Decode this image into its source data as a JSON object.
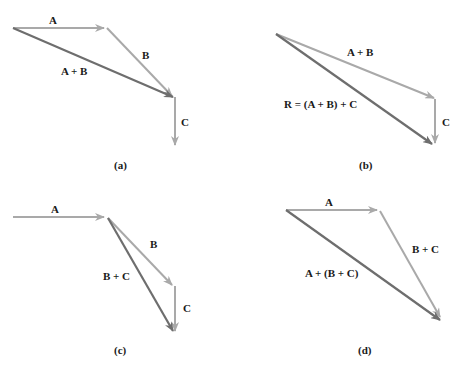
{
  "colors": {
    "light_vector": "#a9a9a9",
    "dark_vector": "#6e6e6e",
    "text": "#1a1a1a",
    "background": "#ffffff"
  },
  "panels": [
    {
      "caption": "(a)",
      "labels": {
        "A": "A",
        "B": "B",
        "AB": "A + B",
        "C": "C"
      }
    },
    {
      "caption": "(b)",
      "labels": {
        "AB": "A + B",
        "R": "R = (A + B) + C",
        "C": "C"
      }
    },
    {
      "caption": "(c)",
      "labels": {
        "A": "A",
        "B": "B",
        "BC": "B + C",
        "C": "C"
      }
    },
    {
      "caption": "(d)",
      "labels": {
        "A": "A",
        "BC": "B + C",
        "ABC": "A + (B + C)"
      }
    }
  ]
}
